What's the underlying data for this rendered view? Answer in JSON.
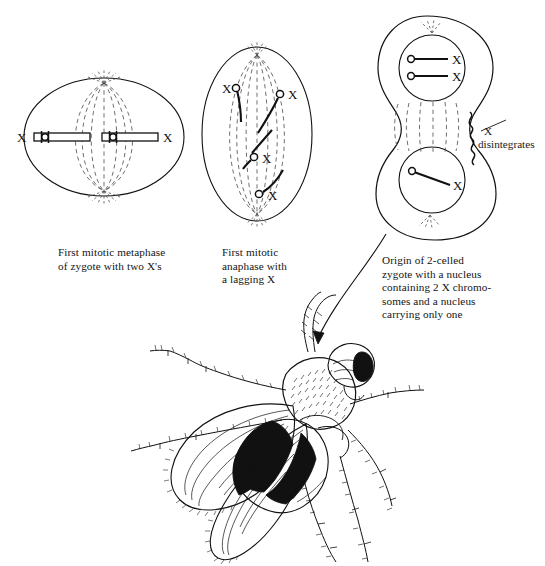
{
  "figure": {
    "title_visible": false,
    "background": "#ffffff",
    "ink": "#111111",
    "dash_color": "#555555"
  },
  "panels": [
    {
      "id": "metaphase",
      "shape": "ellipse",
      "caption": "First mitotic metaphase\nof zygote with two X's",
      "chromosome_labels": [
        "X",
        "X"
      ],
      "chromosome_count": 2,
      "centromere_count": 2,
      "spindle": "bipolar-dashed"
    },
    {
      "id": "anaphase",
      "shape": "ellipse",
      "caption": "First mitotic\nanaphase with\na lagging X",
      "chromosome_labels": [
        "X",
        "X",
        "X",
        "X"
      ],
      "chromosome_count": 4,
      "centromere_count": 4,
      "spindle": "bipolar-dashed"
    },
    {
      "id": "two-celled-zygote",
      "shape": "figure-eight",
      "caption": "Origin of 2-celled\nzygote with a nucleus\ncontaining 2 X chromo-\nsomes and a nucleus\ncarrying only one",
      "top_nucleus_labels": [
        "X",
        "X"
      ],
      "bottom_nucleus_labels": [
        "X"
      ],
      "annotation": {
        "line1": "X",
        "line2": "disintegrates"
      },
      "spindle": "interzonal-dashed"
    }
  ],
  "organism": {
    "name": "drosophila-fly",
    "description": "Drosophila melanogaster line drawing, wings spread, banded abdomen"
  },
  "pointer": {
    "name": "curved-arrow",
    "from_panel": "two-celled-zygote",
    "to": "drosophila-fly"
  }
}
